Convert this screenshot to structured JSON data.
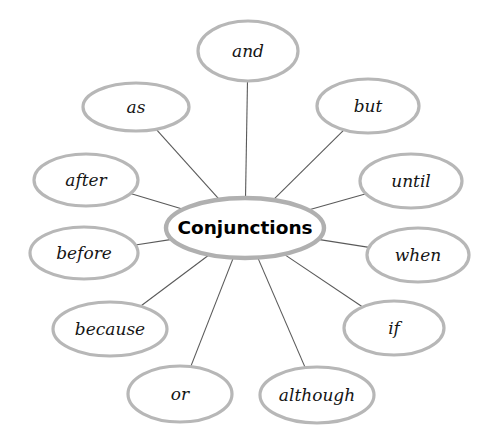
{
  "diagram": {
    "type": "mind-map",
    "title": "Conjunctions",
    "background_color": "#ffffff",
    "node_stroke_color": "#b7b7b7",
    "central_node_stroke_color": "#b0b0b0",
    "connector_color": "#5a5a5a",
    "label_color": "#151515",
    "central": {
      "label": "Conjunctions",
      "cx": 245,
      "cy": 228,
      "rx": 79,
      "ry": 30
    },
    "branches": [
      {
        "label": "and",
        "cx": 248,
        "cy": 51,
        "rx": 50,
        "ry": 30
      },
      {
        "label": "as",
        "cx": 136,
        "cy": 107,
        "rx": 53,
        "ry": 24
      },
      {
        "label": "after",
        "cx": 86,
        "cy": 180,
        "rx": 52,
        "ry": 26
      },
      {
        "label": "before",
        "cx": 84,
        "cy": 253,
        "rx": 54,
        "ry": 26
      },
      {
        "label": "because",
        "cx": 110,
        "cy": 329,
        "rx": 57,
        "ry": 27
      },
      {
        "label": "or",
        "cx": 180,
        "cy": 394,
        "rx": 52,
        "ry": 28
      },
      {
        "label": "although",
        "cx": 317,
        "cy": 395,
        "rx": 57,
        "ry": 28
      },
      {
        "label": "if",
        "cx": 394,
        "cy": 328,
        "rx": 50,
        "ry": 27
      },
      {
        "label": "when",
        "cx": 418,
        "cy": 255,
        "rx": 51,
        "ry": 27
      },
      {
        "label": "until",
        "cx": 411,
        "cy": 181,
        "rx": 51,
        "ry": 27
      },
      {
        "label": "but",
        "cx": 368,
        "cy": 106,
        "rx": 51,
        "ry": 27
      }
    ]
  }
}
